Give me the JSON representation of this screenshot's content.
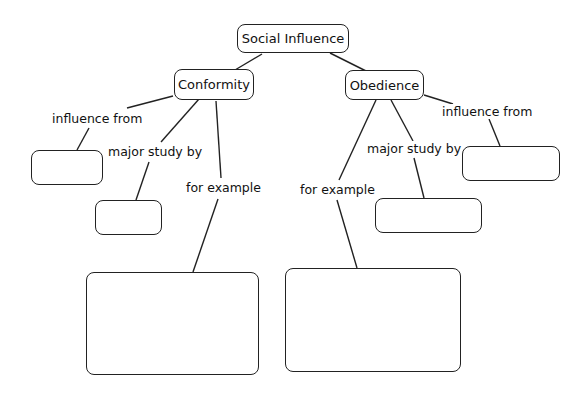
{
  "diagram": {
    "type": "concept-map",
    "root": {
      "label": "Social Influence"
    },
    "branches": [
      {
        "label": "Conformity",
        "links": [
          {
            "label": "influence from",
            "target": ""
          },
          {
            "label": "major study by",
            "target": ""
          },
          {
            "label": "for example",
            "target": ""
          }
        ]
      },
      {
        "label": "Obedience",
        "links": [
          {
            "label": "influence from",
            "target": ""
          },
          {
            "label": "major study by",
            "target": ""
          },
          {
            "label": "for example",
            "target": ""
          }
        ]
      }
    ]
  }
}
